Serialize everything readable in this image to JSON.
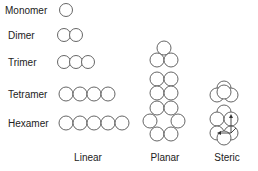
{
  "rows": [
    {
      "label": "Monomer",
      "y": 10,
      "linear_count": 1
    },
    {
      "label": "Dimer",
      "y": 35,
      "linear_count": 2
    },
    {
      "label": "Trimer",
      "y": 62,
      "linear_count": 3
    },
    {
      "label": "Tetramer",
      "y": 94,
      "linear_count": 4
    },
    {
      "label": "Hexamer",
      "y": 123,
      "linear_count": 5
    }
  ],
  "columns": [
    {
      "label": "Linear",
      "x": 88
    },
    {
      "label": "Planar",
      "x": 167
    },
    {
      "label": "Steric",
      "x": 227
    }
  ],
  "colors": {
    "stroke": "#555555",
    "text": "#222222",
    "background": "#ffffff"
  }
}
